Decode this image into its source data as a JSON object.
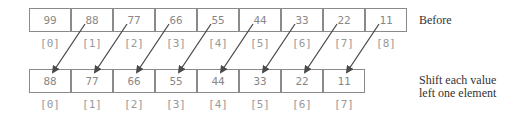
{
  "diagram": {
    "before_row": {
      "values": [
        "99",
        "88",
        "77",
        "66",
        "55",
        "44",
        "33",
        "22",
        "11"
      ],
      "indices": [
        "[0]",
        "[1]",
        "[2]",
        "[3]",
        "[4]",
        "[5]",
        "[6]",
        "[7]",
        "[8]"
      ],
      "label": "Before"
    },
    "after_row": {
      "values": [
        "88",
        "77",
        "66",
        "55",
        "44",
        "33",
        "22",
        "11"
      ],
      "indices": [
        "[0]",
        "[1]",
        "[2]",
        "[3]",
        "[4]",
        "[5]",
        "[6]",
        "[7]"
      ],
      "label_line1": "Shift each value",
      "label_line2": "left one element"
    },
    "arrow_color": "#4a4a4a"
  }
}
